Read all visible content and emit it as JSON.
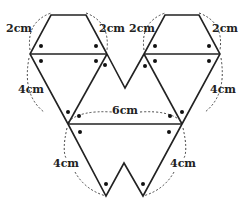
{
  "diagram": {
    "labels": {
      "top_left_left": "2cm",
      "top_left_right": "2cm",
      "top_right_left": "2cm",
      "top_right_right": "2cm",
      "mid_left": "4cm",
      "mid_right": "4cm",
      "middle": "6cm",
      "bottom_left": "4cm",
      "bottom_right": "4cm"
    },
    "colors": {
      "line": "#222222",
      "dashed": "#444444",
      "dot": "#111111"
    }
  }
}
